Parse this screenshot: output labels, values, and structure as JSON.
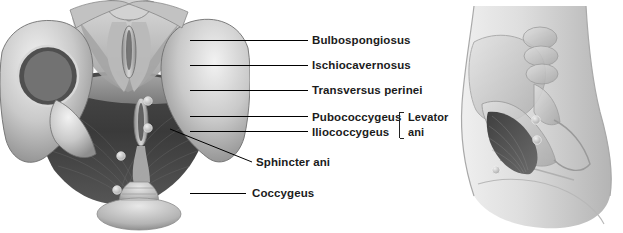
{
  "figure": {
    "background": "#ffffff",
    "leader_color": "#000000",
    "text_color": "#1b1b1b"
  },
  "labels": [
    {
      "id": "bulbospongiosus",
      "text": "Bulbospongiosus"
    },
    {
      "id": "ischiocavernosus",
      "text": "Ischiocavernosus"
    },
    {
      "id": "transversus-perinei",
      "text": "Transversus perinei"
    },
    {
      "id": "pubococcygeus",
      "text": "Pubococcygeus"
    },
    {
      "id": "iliococcygeus",
      "text": "Iliococcygeus"
    },
    {
      "id": "sphincter-ani",
      "text": "Sphincter ani"
    },
    {
      "id": "coccygeus",
      "text": "Coccygeus"
    }
  ],
  "bracket_group": {
    "line1": "Levator",
    "line2": "ani"
  },
  "panels": {
    "left": {
      "name": "pelvic-floor-inferior-view"
    },
    "right": {
      "name": "lateral-torso-orientation-view"
    }
  }
}
